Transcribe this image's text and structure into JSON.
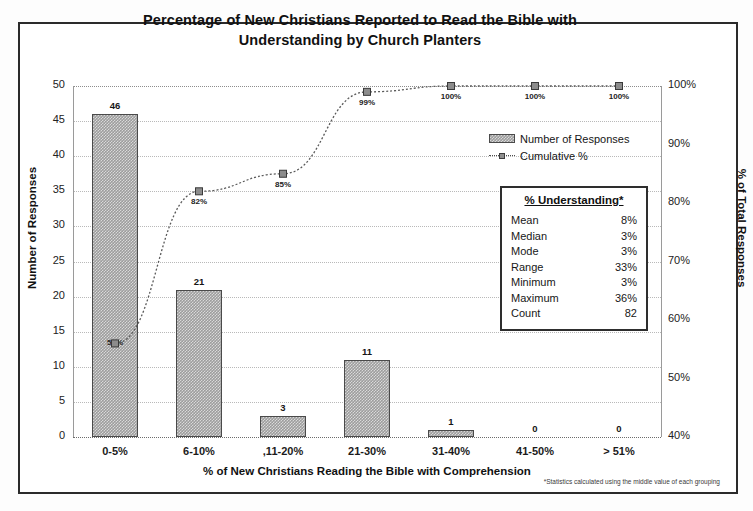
{
  "chart_data": {
    "type": "bar",
    "title": "Percentage of New Christians Reported to Read the Bible with Understanding by Church Planters",
    "title_line1": "Percentage of New Christians Reported to Read the Bible with",
    "title_line2": "Understanding by Church Planters",
    "xlabel": "% of New Christians Reading the Bible with Comprehension",
    "ylabel": "Number of Responses",
    "y2label": "% of Total Responses",
    "categories": [
      "0-5%",
      "6-10%",
      ",11-20%",
      "21-30%",
      "31-40%",
      "41-50%",
      "> 51%"
    ],
    "ylim": [
      0,
      50
    ],
    "yticks": [
      "0",
      "5",
      "10",
      "15",
      "20",
      "25",
      "30",
      "35",
      "40",
      "45",
      "50"
    ],
    "y2lim": [
      40,
      100
    ],
    "y2ticks": [
      "40%",
      "50%",
      "60%",
      "70%",
      "80%",
      "90%",
      "100%"
    ],
    "grid": true,
    "legend_position": "upper-right",
    "series": [
      {
        "name": "Number of Responses",
        "kind": "bar",
        "values": [
          46,
          21,
          3,
          11,
          1,
          0,
          0
        ],
        "labels": [
          "46",
          "21",
          "3",
          "11",
          "1",
          "0",
          "0"
        ]
      },
      {
        "name": "Cumulative %",
        "kind": "line",
        "values": [
          56,
          82,
          85,
          99,
          100,
          100,
          100
        ],
        "labels": [
          "56%",
          "82%",
          "85%",
          "99%",
          "100%",
          "100%",
          "100%"
        ]
      }
    ],
    "bar_interior_labels": [
      "56%",
      "",
      "",
      "",
      "",
      "",
      ""
    ],
    "annotations": [
      "*Statistics calculated using the middle value of each grouping"
    ]
  },
  "legend": {
    "items": [
      {
        "label": "Number of Responses",
        "marker": "bar-swatch-icon"
      },
      {
        "label": "Cumulative %",
        "marker": "line-marker-icon"
      }
    ]
  },
  "stats_box": {
    "title": "% Understanding*",
    "rows": [
      {
        "label": "Mean",
        "value": "8%"
      },
      {
        "label": "Median",
        "value": "3%"
      },
      {
        "label": "Mode",
        "value": "3%"
      },
      {
        "label": "Range",
        "value": "33%"
      },
      {
        "label": "Minimum",
        "value": "3%"
      },
      {
        "label": "Maximum",
        "value": "36%"
      },
      {
        "label": "Count",
        "value": "82"
      }
    ]
  },
  "footnote": "*Statistics calculated using the middle value of each grouping"
}
